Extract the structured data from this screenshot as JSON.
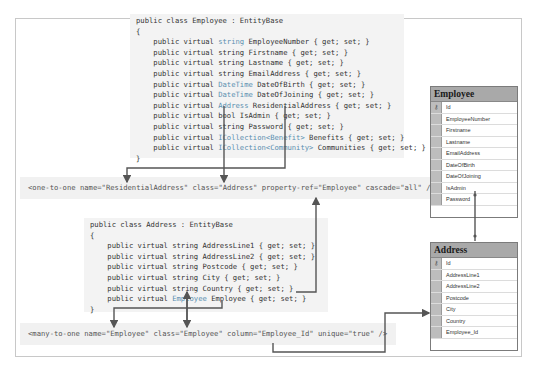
{
  "employee_class": {
    "header": "public class Employee : EntityBase",
    "open": "{",
    "close": "}",
    "lines": [
      {
        "prefix": "    public virtual ",
        "type": "string",
        "member": " EmployeeNumber { get; set; }"
      },
      {
        "prefix": "    public virtual ",
        "type": "string",
        "member": " Firstname { get; set; }"
      },
      {
        "prefix": "    public virtual ",
        "type": "string",
        "member": " Lastname { get; set; }"
      },
      {
        "prefix": "    public virtual ",
        "type": "string",
        "member": " EmailAddress { get; set; }"
      },
      {
        "prefix": "    public virtual ",
        "type": "DateTime",
        "member": " DateOfBirth { get; set; }"
      },
      {
        "prefix": "    public virtual ",
        "type": "DateTime",
        "member": " DateOfJoining { get; set; }"
      },
      {
        "prefix": "    public virtual ",
        "type": "Address",
        "member": " ResidentialAddress { get; set; }"
      },
      {
        "prefix": "    public virtual ",
        "type": "bool",
        "member": " IsAdmin { get; set; }"
      },
      {
        "prefix": "    public virtual ",
        "type": "string",
        "member": " Password { get; set; }"
      },
      {
        "prefix": "    public virtual ",
        "type": "ICollection<Benefit>",
        "member": " Benefits { get; set; }"
      },
      {
        "prefix": "    public virtual ",
        "type": "ICollection<Community>",
        "member": " Communities { get; set; }"
      }
    ]
  },
  "one_to_one_mapping": {
    "tag_open": "<one-to-one ",
    "attrs": [
      {
        "name": "name=",
        "value": "\"ResidentialAddress\""
      },
      {
        "name": " class=",
        "value": "\"Address\""
      },
      {
        "name": " property-ref=",
        "value": "\"Employee\""
      },
      {
        "name": " cascade=",
        "value": "\"all\""
      }
    ],
    "tag_close": " />"
  },
  "address_class": {
    "header": "public class Address : EntityBase",
    "open": "{",
    "close": "}",
    "lines": [
      {
        "prefix": "    public virtual ",
        "type": "string",
        "member": " AddressLine1 { get; set; }"
      },
      {
        "prefix": "    public virtual ",
        "type": "string",
        "member": " AddressLine2 { get; set; }"
      },
      {
        "prefix": "    public virtual ",
        "type": "string",
        "member": " Postcode { get; set; }"
      },
      {
        "prefix": "    public virtual ",
        "type": "string",
        "member": " City { get; set; }"
      },
      {
        "prefix": "    public virtual ",
        "type": "string",
        "member": " Country { get; set; }"
      },
      {
        "prefix": "    public virtual ",
        "type": "Employee",
        "member": " Employee { get; set; }"
      }
    ]
  },
  "many_to_one_mapping": {
    "tag_open": "<many-to-one ",
    "attrs": [
      {
        "name": "name=",
        "value": "\"Employee\""
      },
      {
        "name": " class=",
        "value": "\"Employee\""
      },
      {
        "name": " column=",
        "value": "\"Employee_Id\""
      },
      {
        "name": " unique=",
        "value": "\"true\""
      }
    ],
    "tag_close": " />"
  },
  "employee_table": {
    "title": "Employee",
    "key_icon": "key-icon",
    "columns": [
      "Id",
      "EmployeeNumber",
      "Firstname",
      "Lastname",
      "EmailAddress",
      "DateOfBirth",
      "DateOfJoining",
      "IsAdmin",
      "Password"
    ]
  },
  "address_table": {
    "title": "Address",
    "key_icon": "key-icon",
    "columns": [
      "Id",
      "AddressLine1",
      "AddressLine2",
      "Postcode",
      "City",
      "Country",
      "Employee_Id"
    ]
  },
  "colors": {
    "code_bg": "#f3f3f3",
    "type_color": "#5a8fb0",
    "table_header": "#a9a9a9",
    "arrow": "#555555"
  }
}
